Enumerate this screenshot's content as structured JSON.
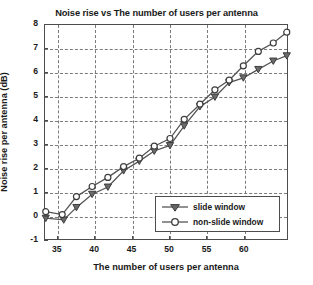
{
  "chart_data": {
    "type": "line",
    "title": "Noise rise vs The number of users per antenna",
    "xlabel": "The number of users per antenna",
    "ylabel": "Noise rise per antenna (dB)",
    "xlim": [
      33.3,
      65.9
    ],
    "ylim": [
      -1,
      8
    ],
    "xticks": [
      35,
      40,
      45,
      50,
      55,
      60
    ],
    "yticks": [
      -1,
      0,
      1,
      2,
      3,
      4,
      5,
      6,
      7,
      8
    ],
    "grid": true,
    "grid_style": "dashed",
    "legend_position": "lower right",
    "line_color": "#555555",
    "series": [
      {
        "name": "slide window",
        "marker": "triangle-down",
        "x": [
          33.4,
          35.8,
          37.5,
          39.6,
          41.7,
          43.8,
          45.9,
          47.9,
          50.0,
          51.9,
          54.0,
          56.0,
          57.9,
          59.8,
          61.8,
          63.8,
          65.6
        ],
        "y": [
          -0.05,
          -0.12,
          0.4,
          0.95,
          1.25,
          1.93,
          2.33,
          2.75,
          2.98,
          3.8,
          4.6,
          5.0,
          5.6,
          5.8,
          6.15,
          6.5,
          6.72
        ]
      },
      {
        "name": "non-slide window",
        "marker": "circle",
        "x": [
          33.4,
          35.6,
          37.5,
          39.6,
          41.7,
          43.8,
          45.9,
          47.9,
          50.0,
          51.9,
          54.0,
          56.0,
          57.9,
          59.8,
          61.8,
          63.8,
          65.6
        ],
        "y": [
          0.22,
          0.1,
          0.85,
          1.27,
          1.65,
          2.1,
          2.45,
          2.95,
          3.27,
          4.07,
          4.7,
          5.3,
          5.7,
          6.3,
          6.9,
          7.25,
          7.7
        ]
      }
    ]
  },
  "legend": {
    "items": [
      {
        "label": "slide window"
      },
      {
        "label": "non-slide window"
      }
    ]
  }
}
